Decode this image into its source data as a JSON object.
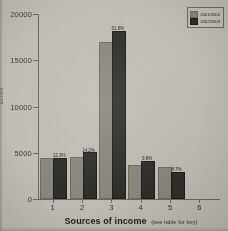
{
  "chart_data": {
    "type": "bar",
    "title": "",
    "xlabel": "Sources of income",
    "xlabel_note": "(see table for key)",
    "ylabel": "£000s",
    "categories": [
      "1",
      "2",
      "3",
      "4",
      "5",
      "6"
    ],
    "ylim": [
      0,
      20000
    ],
    "yticks": [
      0,
      5000,
      10000,
      15000,
      20000
    ],
    "ytick_labels": [
      "0",
      "5000",
      "10000",
      "15000",
      "20000"
    ],
    "grid": false,
    "legend_position": "top-right",
    "series": [
      {
        "name": "2001/2002",
        "color": "#8b8880",
        "values": [
          4200,
          4350,
          16800,
          3450,
          3250,
          0
        ]
      },
      {
        "name": "2002/2003",
        "color": "#2f2e2b",
        "values": [
          4250,
          4850,
          18000,
          3900,
          2750,
          0
        ],
        "data_labels": [
          "12.3%",
          "14.2%",
          "51.6%",
          "9.8%",
          "8.7%",
          ""
        ]
      }
    ]
  },
  "axes": {
    "y_title": "£000s",
    "x_title_main": "Sources of income",
    "x_title_sub": "(see table for key)"
  },
  "legend": {
    "entries": [
      {
        "label": "2001/2002",
        "color": "#8b8880"
      },
      {
        "label": "2002/2003",
        "color": "#2f2e2b"
      }
    ]
  },
  "colors": {
    "background": "#c3c0b7",
    "axis": "#6d6a62",
    "series1": "#8b8880",
    "series2": "#2f2e2b",
    "text": "#24231f"
  }
}
